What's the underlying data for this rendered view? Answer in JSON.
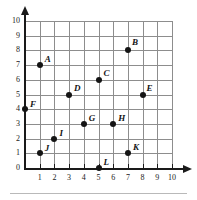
{
  "figure": {
    "type": "coordinate-plane",
    "title": "",
    "axes": {
      "x_label": "",
      "y_label": "",
      "x_ticks": [
        "1",
        "2",
        "3",
        "4",
        "5",
        "6",
        "7",
        "8",
        "9",
        "10"
      ],
      "y_ticks": [
        "0",
        "1",
        "2",
        "3",
        "4",
        "5",
        "6",
        "7",
        "8",
        "9",
        "10"
      ],
      "xlim": [
        0,
        10
      ],
      "ylim": [
        0,
        10
      ],
      "grid": true
    },
    "points": [
      {
        "label": "A",
        "x": 1,
        "y": 7,
        "label_dx": 5,
        "label_dy": -10
      },
      {
        "label": "B",
        "x": 7,
        "y": 8,
        "label_dx": 4,
        "label_dy": -12
      },
      {
        "label": "C",
        "x": 5,
        "y": 6,
        "label_dx": 5,
        "label_dy": -11
      },
      {
        "label": "D",
        "x": 3,
        "y": 5,
        "label_dx": 5,
        "label_dy": -11
      },
      {
        "label": "E",
        "x": 8,
        "y": 5,
        "label_dx": 4,
        "label_dy": -11
      },
      {
        "label": "F",
        "x": 0,
        "y": 4,
        "label_dx": 5,
        "label_dy": -9
      },
      {
        "label": "G",
        "x": 4,
        "y": 3,
        "label_dx": 5,
        "label_dy": -10
      },
      {
        "label": "H",
        "x": 6,
        "y": 3,
        "label_dx": 5,
        "label_dy": -10
      },
      {
        "label": "I",
        "x": 2,
        "y": 2,
        "label_dx": 5,
        "label_dy": -10
      },
      {
        "label": "J",
        "x": 1,
        "y": 1,
        "label_dx": 5,
        "label_dy": -9
      },
      {
        "label": "K",
        "x": 7,
        "y": 1,
        "label_dx": 5,
        "label_dy": -10
      },
      {
        "label": "L",
        "x": 5,
        "y": 0,
        "label_dx": 5,
        "label_dy": -10
      }
    ],
    "colors": {
      "point": "#141414",
      "gridline": "#8d8d8d",
      "axis": "#1a1a1a",
      "background": "#ffffff"
    }
  },
  "chart_data": {
    "type": "scatter",
    "title": "",
    "xlabel": "",
    "ylabel": "",
    "xlim": [
      0,
      10
    ],
    "ylim": [
      0,
      10
    ],
    "grid": true,
    "legend": "none",
    "x_tick_labels": [
      "1",
      "2",
      "3",
      "4",
      "5",
      "6",
      "7",
      "8",
      "9",
      "10"
    ],
    "y_tick_labels": [
      "0",
      "1",
      "2",
      "3",
      "4",
      "5",
      "6",
      "7",
      "8",
      "9",
      "10"
    ],
    "series": [
      {
        "name": "labeled points",
        "point_labels": [
          "A",
          "B",
          "C",
          "D",
          "E",
          "F",
          "G",
          "H",
          "I",
          "J",
          "K",
          "L"
        ],
        "x": [
          1,
          7,
          5,
          3,
          8,
          0,
          4,
          6,
          2,
          1,
          7,
          5
        ],
        "y": [
          7,
          8,
          6,
          5,
          5,
          4,
          3,
          3,
          2,
          1,
          1,
          0
        ]
      }
    ]
  }
}
